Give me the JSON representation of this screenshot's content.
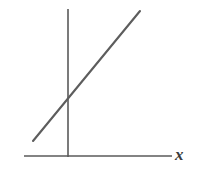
{
  "figure": {
    "background_color": "#ffffff",
    "width": 202,
    "height": 177,
    "axis_color": "#5a5a5a",
    "line_color": "#5d5d5d",
    "label_color": "#3b3b3b"
  },
  "labels": {
    "x_axis": "x"
  },
  "chart_data": {
    "type": "line",
    "title": "",
    "subtitle": "",
    "xlabel": "x",
    "ylabel": "",
    "grid": false,
    "legend": null,
    "axes": {
      "x_axis": {
        "drawn": true,
        "label": "x",
        "tick_labels": [],
        "pixel_start": [
          24,
          156
        ],
        "pixel_end": [
          172,
          156
        ]
      },
      "y_axis": {
        "drawn": true,
        "label": "",
        "tick_labels": [],
        "pixel_start": [
          68,
          9
        ],
        "pixel_end": [
          68,
          157
        ]
      },
      "origin_pixel": [
        68,
        156
      ]
    },
    "series": [
      {
        "name": "line",
        "description": "straight line with positive slope and positive y-intercept",
        "x": [
          -0.32,
          1.0
        ],
        "y": [
          -0.18,
          1.78
        ],
        "pixel_points": [
          [
            33,
            141
          ],
          [
            140,
            11
          ]
        ],
        "slope_pixels_per_pixel": -1.215,
        "y_intercept_pixel": [
          68,
          98
        ]
      }
    ],
    "annotations": []
  }
}
